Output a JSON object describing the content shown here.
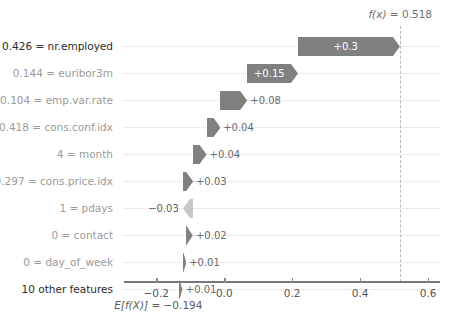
{
  "chart_data": {
    "type": "bar",
    "chart_style": "shap-waterfall",
    "title": "",
    "xlabel": "",
    "ylabel": "",
    "base_value_label": "E[f(X)] = -0.194",
    "base_value": -0.194,
    "output_value_label": "f(x) = 0.518",
    "output_value": 0.518,
    "xlim": [
      -0.295,
      0.635
    ],
    "xticks": [
      -0.2,
      0.0,
      0.2,
      0.4,
      0.6
    ],
    "xtick_labels": [
      "−0.2",
      "0.0",
      "0.2",
      "0.4",
      "0.6"
    ],
    "grid": false,
    "legend": "none",
    "positive_color": "#808080",
    "negative_color": "#c8c8c8",
    "features": [
      {
        "label": "0.426 = nr.employed",
        "value_label": "+0.3",
        "value": 0.3,
        "start": 0.218,
        "end": 0.518,
        "direction": "positive",
        "emphasis": "dark",
        "label_placement": "inside"
      },
      {
        "label": "0.144 = euribor3m",
        "value_label": "+0.15",
        "value": 0.15,
        "start": 0.068,
        "end": 0.218,
        "direction": "positive",
        "emphasis": "gray",
        "label_placement": "inside"
      },
      {
        "label": "0.104 = emp.var.rate",
        "value_label": "+0.08",
        "value": 0.08,
        "start": -0.012,
        "end": 0.068,
        "direction": "positive",
        "emphasis": "gray",
        "label_placement": "outside-right"
      },
      {
        "label": "0.418 = cons.conf.idx",
        "value_label": "+0.04",
        "value": 0.04,
        "start": -0.052,
        "end": -0.012,
        "direction": "positive",
        "emphasis": "gray",
        "label_placement": "outside-right"
      },
      {
        "label": "4 = month",
        "value_label": "+0.04",
        "value": 0.04,
        "start": -0.092,
        "end": -0.052,
        "direction": "positive",
        "emphasis": "gray",
        "label_placement": "outside-right"
      },
      {
        "label": "0.297 = cons.price.idx",
        "value_label": "+0.03",
        "value": 0.03,
        "start": -0.122,
        "end": -0.092,
        "direction": "positive",
        "emphasis": "gray",
        "label_placement": "outside-right"
      },
      {
        "label": "1 = pdays",
        "value_label": "−0.03",
        "value": -0.03,
        "start": -0.092,
        "end": -0.122,
        "direction": "negative",
        "emphasis": "gray",
        "label_placement": "outside-left"
      },
      {
        "label": "0 = contact",
        "value_label": "+0.02",
        "value": 0.02,
        "start": -0.112,
        "end": -0.092,
        "direction": "positive",
        "emphasis": "gray",
        "label_placement": "outside-right"
      },
      {
        "label": "0 = day_of_week",
        "value_label": "+0.01",
        "value": 0.01,
        "start": -0.122,
        "end": -0.112,
        "direction": "positive",
        "emphasis": "gray",
        "label_placement": "outside-right"
      },
      {
        "label": "10 other features",
        "value_label": "+0.01",
        "value": 0.01,
        "start": -0.132,
        "end": -0.122,
        "direction": "positive",
        "emphasis": "dark",
        "label_placement": "outside-right"
      }
    ]
  }
}
